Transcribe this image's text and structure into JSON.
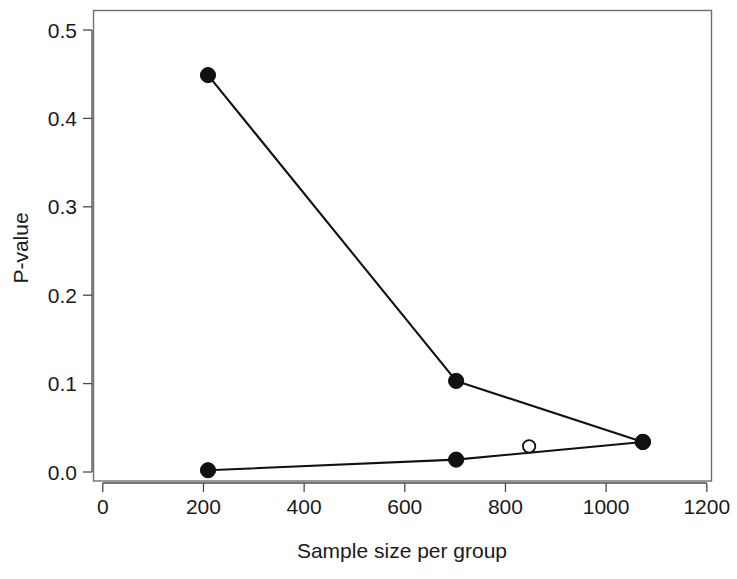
{
  "chart_data": {
    "type": "line",
    "title": "",
    "subtitle": "",
    "xlabel": "Sample size per group",
    "ylabel": "P-value",
    "xlim": [
      -12,
      1212
    ],
    "ylim": [
      -0.012,
      0.512
    ],
    "grid": false,
    "legend": "none",
    "xticks": [
      0,
      200,
      400,
      600,
      800,
      1000,
      1200
    ],
    "xtick_labels": [
      "0",
      "200",
      "400",
      "600",
      "800",
      "1000",
      "1200"
    ],
    "yticks": [
      0.0,
      0.1,
      0.2,
      0.3,
      0.4,
      0.5
    ],
    "ytick_labels": [
      "0.0",
      "0.1",
      "0.2",
      "0.3",
      "0.4",
      "0.5"
    ],
    "series": [
      {
        "name": "upper-series",
        "marker": "filled-circle",
        "x": [
          209,
          702,
          1073
        ],
        "values": [
          0.449,
          0.103,
          0.034
        ]
      },
      {
        "name": "lower-series",
        "marker": "filled-circle",
        "x": [
          209,
          702,
          1073
        ],
        "values": [
          0.002,
          0.014,
          0.034
        ]
      },
      {
        "name": "open-point",
        "marker": "open-circle",
        "x": [
          847
        ],
        "values": [
          0.029
        ]
      }
    ],
    "annotations": []
  },
  "figure": {
    "background_color": "#ffffff",
    "line_color": "#111111",
    "axis_color": "#6f6f6f",
    "text_color": "#1a1a1a"
  }
}
